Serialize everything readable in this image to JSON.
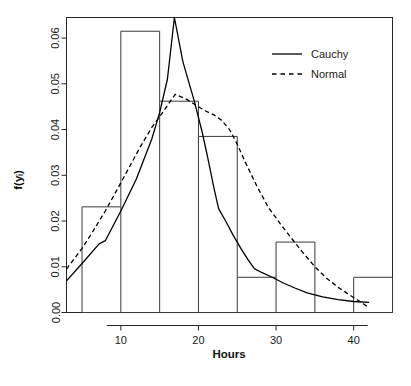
{
  "chart_data": {
    "type": "bar",
    "title": "",
    "subtitle": "",
    "xlabel": "Hours",
    "ylabel": "f(yᵢ)",
    "ylabel_plain": "f(yi)",
    "xlim": [
      3.0,
      45.0
    ],
    "ylim": [
      0.0,
      0.0645
    ],
    "grid": false,
    "legend_position": "top-right",
    "x_ticks": [
      10,
      20,
      30,
      40
    ],
    "x_tick_labels": [
      "10",
      "20",
      "30",
      "40"
    ],
    "y_ticks": [
      0.0,
      0.01,
      0.02,
      0.03,
      0.04,
      0.05,
      0.06
    ],
    "y_tick_labels": [
      "0.00",
      "0.01",
      "0.02",
      "0.03",
      "0.04",
      "0.05",
      "0.06"
    ],
    "histogram": {
      "name": "Histogram of hours",
      "bin_edges": [
        5,
        10,
        15,
        20,
        25,
        30,
        35,
        40,
        45
      ],
      "bin_labels": [
        "5-10",
        "10-15",
        "15-20",
        "20-25",
        "25-30",
        "30-35",
        "35-40",
        "40-45"
      ],
      "densities": [
        0.0231,
        0.0615,
        0.0462,
        0.0385,
        0.0077,
        0.0154,
        0.0,
        0.0077
      ]
    },
    "series": [
      {
        "name": "Cauchy",
        "style": "solid",
        "color": "#000000",
        "x": [
          3.0,
          5.2,
          7.2,
          8.0,
          10.0,
          12.0,
          14.0,
          15.0,
          16.0,
          16.9,
          18.0,
          19.5,
          20.5,
          21.2,
          22.0,
          22.6,
          23.5,
          24.5,
          25.5,
          26.4,
          27.2,
          28.2,
          29.5,
          31.0,
          32.5,
          34.0,
          36.0,
          38.0,
          40.0,
          42.0
        ],
        "y": [
          0.0069,
          0.0111,
          0.015,
          0.0157,
          0.0222,
          0.0292,
          0.038,
          0.0437,
          0.051,
          0.0645,
          0.0548,
          0.046,
          0.0393,
          0.0338,
          0.0272,
          0.0227,
          0.02,
          0.0168,
          0.0139,
          0.0115,
          0.0096,
          0.0087,
          0.0077,
          0.0064,
          0.0053,
          0.0043,
          0.0034,
          0.0028,
          0.0024,
          0.0022
        ]
      },
      {
        "name": "Normal",
        "style": "dashed",
        "color": "#000000",
        "x": [
          3.0,
          5.0,
          6.5,
          8.0,
          9.5,
          11.0,
          12.5,
          14.0,
          15.5,
          17.0,
          18.5,
          20.0,
          21.0,
          22.0,
          23.0,
          24.0,
          25.0,
          26.0,
          27.5,
          29.0,
          30.5,
          32.0,
          33.5,
          35.0,
          36.5,
          38.0,
          39.5,
          41.0,
          42.0
        ],
        "y": [
          0.0095,
          0.014,
          0.018,
          0.0222,
          0.0268,
          0.0315,
          0.0362,
          0.0405,
          0.044,
          0.0477,
          0.0466,
          0.045,
          0.044,
          0.0432,
          0.042,
          0.04,
          0.0368,
          0.033,
          0.0277,
          0.023,
          0.0195,
          0.0162,
          0.013,
          0.01,
          0.0075,
          0.0055,
          0.0038,
          0.0022,
          0.001
        ]
      }
    ],
    "legend": [
      {
        "label": "Cauchy",
        "style": "solid"
      },
      {
        "label": "Normal",
        "style": "dashed"
      }
    ]
  }
}
